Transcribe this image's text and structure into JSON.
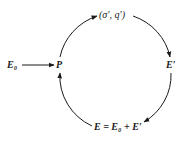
{
  "diagram": {
    "type": "cycle",
    "nodes": {
      "input": {
        "label": "E₀"
      },
      "left": {
        "label": "P"
      },
      "top": {
        "label": "(σ′, q′)"
      },
      "right": {
        "label": "E′"
      },
      "bottom": {
        "label": "E = E₀ + E′"
      }
    },
    "edges": [
      {
        "from": "E₀",
        "to": "P"
      },
      {
        "from": "P",
        "to": "(σ′, q′)"
      },
      {
        "from": "(σ′, q′)",
        "to": "E′"
      },
      {
        "from": "E′",
        "to": "E = E₀ + E′"
      },
      {
        "from": "E = E₀ + E′",
        "to": "P"
      }
    ],
    "colors": {
      "stroke": "#1a1a1a",
      "background": "#ffffff"
    }
  }
}
